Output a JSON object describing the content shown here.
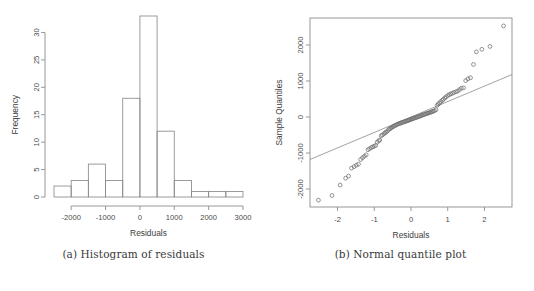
{
  "figure": {
    "panels": [
      {
        "id": "a",
        "caption": "(a) Histogram of residuals"
      },
      {
        "id": "b",
        "caption": "(b) Normal quantile plot"
      }
    ]
  },
  "chart_data": [
    {
      "type": "bar",
      "subtype": "histogram",
      "title": "",
      "xlabel": "Residuals",
      "ylabel": "Frequency",
      "xlim": [
        -2500,
        3000
      ],
      "ylim": [
        0,
        33
      ],
      "grid": false,
      "legend": "none",
      "bin_width": 500,
      "bin_edges": [
        -2500,
        -2000,
        -1500,
        -1000,
        -500,
        0,
        500,
        1000,
        1500,
        2000,
        2500,
        3000
      ],
      "categories": [
        "-2500 to -2000",
        "-2000 to -1500",
        "-1500 to -1000",
        "-1000 to -500",
        "-500 to 0",
        "0 to 500",
        "500 to 1000",
        "1000 to 1500",
        "1500 to 2000",
        "2000 to 2500",
        "2500 to 3000"
      ],
      "values": [
        2,
        3,
        6,
        3,
        18,
        33,
        12,
        3,
        1,
        1,
        1
      ],
      "xticks": [
        -2000,
        -1000,
        0,
        1000,
        2000,
        3000
      ],
      "xticklabels": [
        "-2000",
        "-1000",
        "0",
        "1000",
        "2000",
        "3000"
      ],
      "yticks": [
        0,
        5,
        10,
        15,
        20,
        25,
        30
      ],
      "yticklabels": [
        "0",
        "5",
        "10",
        "15",
        "20",
        "25",
        "30"
      ]
    },
    {
      "type": "scatter",
      "subtype": "normal-qq",
      "title": "",
      "xlabel": "Residuals",
      "ylabel": "Sample Quantiles",
      "xlim": [
        -2.75,
        2.75
      ],
      "ylim": [
        -2500,
        2750
      ],
      "grid": false,
      "legend": "none",
      "frame": true,
      "xticks": [
        -2,
        -1,
        0,
        1,
        2
      ],
      "xticklabels": [
        "-2",
        "-1",
        "0",
        "1",
        "2"
      ],
      "yticks": [
        -2000,
        -1000,
        0,
        1000,
        2000
      ],
      "yticklabels": [
        "-2000",
        "-1000",
        "0",
        "1000",
        "2000"
      ],
      "reference_line": {
        "x": [
          -2.75,
          2.75
        ],
        "y": [
          -1180,
          1180
        ]
      },
      "points": [
        [
          -2.52,
          -2310
        ],
        [
          -2.15,
          -2180
        ],
        [
          -1.93,
          -1890
        ],
        [
          -1.78,
          -1700
        ],
        [
          -1.7,
          -1640
        ],
        [
          -1.62,
          -1420
        ],
        [
          -1.55,
          -1380
        ],
        [
          -1.49,
          -1340
        ],
        [
          -1.43,
          -1310
        ],
        [
          -1.37,
          -1180
        ],
        [
          -1.32,
          -1130
        ],
        [
          -1.27,
          -1090
        ],
        [
          -1.22,
          -1050
        ],
        [
          -1.17,
          -910
        ],
        [
          -1.13,
          -880
        ],
        [
          -1.08,
          -850
        ],
        [
          -1.04,
          -830
        ],
        [
          -1.0,
          -810
        ],
        [
          -0.96,
          -790
        ],
        [
          -0.92,
          -700
        ],
        [
          -0.88,
          -660
        ],
        [
          -0.85,
          -640
        ],
        [
          -0.81,
          -520
        ],
        [
          -0.78,
          -500
        ],
        [
          -0.74,
          -470
        ],
        [
          -0.71,
          -440
        ],
        [
          -0.68,
          -420
        ],
        [
          -0.64,
          -390
        ],
        [
          -0.61,
          -350
        ],
        [
          -0.58,
          -330
        ],
        [
          -0.55,
          -310
        ],
        [
          -0.52,
          -290
        ],
        [
          -0.49,
          -270
        ],
        [
          -0.46,
          -250
        ],
        [
          -0.43,
          -235
        ],
        [
          -0.4,
          -220
        ],
        [
          -0.37,
          -205
        ],
        [
          -0.34,
          -190
        ],
        [
          -0.31,
          -180
        ],
        [
          -0.29,
          -170
        ],
        [
          -0.26,
          -160
        ],
        [
          -0.23,
          -150
        ],
        [
          -0.2,
          -140
        ],
        [
          -0.17,
          -130
        ],
        [
          -0.15,
          -120
        ],
        [
          -0.12,
          -110
        ],
        [
          -0.09,
          -100
        ],
        [
          -0.06,
          -90
        ],
        [
          -0.04,
          -80
        ],
        [
          -0.01,
          -70
        ],
        [
          0.01,
          -60
        ],
        [
          0.04,
          -50
        ],
        [
          0.06,
          -40
        ],
        [
          0.09,
          -30
        ],
        [
          0.12,
          -20
        ],
        [
          0.15,
          -10
        ],
        [
          0.17,
          0
        ],
        [
          0.2,
          10
        ],
        [
          0.23,
          20
        ],
        [
          0.26,
          30
        ],
        [
          0.29,
          45
        ],
        [
          0.31,
          55
        ],
        [
          0.34,
          65
        ],
        [
          0.37,
          75
        ],
        [
          0.4,
          85
        ],
        [
          0.43,
          95
        ],
        [
          0.46,
          105
        ],
        [
          0.49,
          115
        ],
        [
          0.52,
          125
        ],
        [
          0.55,
          140
        ],
        [
          0.58,
          150
        ],
        [
          0.61,
          160
        ],
        [
          0.64,
          175
        ],
        [
          0.68,
          200
        ],
        [
          0.71,
          320
        ],
        [
          0.74,
          360
        ],
        [
          0.78,
          390
        ],
        [
          0.81,
          430
        ],
        [
          0.85,
          460
        ],
        [
          0.88,
          490
        ],
        [
          0.92,
          530
        ],
        [
          0.96,
          560
        ],
        [
          1.0,
          600
        ],
        [
          1.04,
          620
        ],
        [
          1.08,
          640
        ],
        [
          1.13,
          660
        ],
        [
          1.17,
          680
        ],
        [
          1.22,
          700
        ],
        [
          1.27,
          720
        ],
        [
          1.32,
          760
        ],
        [
          1.37,
          800
        ],
        [
          1.43,
          810
        ],
        [
          1.49,
          1010
        ],
        [
          1.55,
          1060
        ],
        [
          1.62,
          1090
        ],
        [
          1.7,
          1460
        ],
        [
          1.78,
          1810
        ],
        [
          1.93,
          1880
        ],
        [
          2.15,
          1960
        ],
        [
          2.52,
          2530
        ]
      ]
    }
  ]
}
